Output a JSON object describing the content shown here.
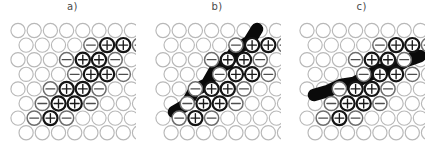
{
  "figure": {
    "background": "#ffffff",
    "panel_count": 3,
    "grid": {
      "rows": 8,
      "cols": 8,
      "spacing_x": 16.2,
      "spacing_y": 14.6,
      "row_offset_x": 8.1,
      "radius": 7.1,
      "origin_x": 9.0,
      "origin_y": 8.5
    },
    "colors": {
      "empty_stroke": "#b8b8b8",
      "minus_stroke": "#6e6e6e",
      "plus_stroke": "#141414",
      "band": "#0a0a0a",
      "label": "#4a4a4a",
      "page_background": "#ffffff"
    },
    "legend_symbols": {
      "empty": "",
      "minus": "−",
      "plus": "+"
    }
  },
  "panels": [
    {
      "id": "panel-a",
      "label": "a)",
      "has_band": false,
      "band_points": [],
      "band_width": 0,
      "charges": [
        {
          "row": 1,
          "col": 4,
          "type": "minus"
        },
        {
          "row": 1,
          "col": 5,
          "type": "plus"
        },
        {
          "row": 1,
          "col": 6,
          "type": "plus"
        },
        {
          "row": 1,
          "col": 7,
          "type": "minus"
        },
        {
          "row": 2,
          "col": 3,
          "type": "minus"
        },
        {
          "row": 2,
          "col": 4,
          "type": "plus"
        },
        {
          "row": 2,
          "col": 5,
          "type": "plus"
        },
        {
          "row": 2,
          "col": 6,
          "type": "minus"
        },
        {
          "row": 3,
          "col": 3,
          "type": "minus"
        },
        {
          "row": 3,
          "col": 4,
          "type": "plus"
        },
        {
          "row": 3,
          "col": 5,
          "type": "plus"
        },
        {
          "row": 3,
          "col": 6,
          "type": "minus"
        },
        {
          "row": 4,
          "col": 2,
          "type": "minus"
        },
        {
          "row": 4,
          "col": 3,
          "type": "plus"
        },
        {
          "row": 4,
          "col": 4,
          "type": "plus"
        },
        {
          "row": 4,
          "col": 5,
          "type": "minus"
        },
        {
          "row": 5,
          "col": 1,
          "type": "minus"
        },
        {
          "row": 5,
          "col": 2,
          "type": "plus"
        },
        {
          "row": 5,
          "col": 3,
          "type": "plus"
        },
        {
          "row": 5,
          "col": 4,
          "type": "minus"
        },
        {
          "row": 6,
          "col": 1,
          "type": "minus"
        },
        {
          "row": 6,
          "col": 2,
          "type": "plus"
        },
        {
          "row": 6,
          "col": 3,
          "type": "minus"
        }
      ]
    },
    {
      "id": "panel-b",
      "label": "b)",
      "has_band": true,
      "band_width": 12.5,
      "band_points": [
        [
          103.0,
          7.0
        ],
        [
          95.0,
          20.0
        ],
        [
          82.0,
          27.0
        ],
        [
          74.0,
          41.0
        ],
        [
          61.0,
          48.0
        ],
        [
          53.0,
          62.0
        ],
        [
          40.0,
          69.0
        ],
        [
          32.0,
          83.0
        ],
        [
          20.0,
          90.0
        ]
      ],
      "charges": [
        {
          "row": 1,
          "col": 4,
          "type": "minus"
        },
        {
          "row": 1,
          "col": 5,
          "type": "plus"
        },
        {
          "row": 1,
          "col": 6,
          "type": "plus"
        },
        {
          "row": 1,
          "col": 7,
          "type": "minus"
        },
        {
          "row": 2,
          "col": 3,
          "type": "minus"
        },
        {
          "row": 2,
          "col": 4,
          "type": "plus"
        },
        {
          "row": 2,
          "col": 5,
          "type": "plus"
        },
        {
          "row": 2,
          "col": 6,
          "type": "minus"
        },
        {
          "row": 3,
          "col": 3,
          "type": "minus"
        },
        {
          "row": 3,
          "col": 4,
          "type": "plus"
        },
        {
          "row": 3,
          "col": 5,
          "type": "plus"
        },
        {
          "row": 3,
          "col": 6,
          "type": "minus"
        },
        {
          "row": 4,
          "col": 2,
          "type": "minus"
        },
        {
          "row": 4,
          "col": 3,
          "type": "plus"
        },
        {
          "row": 4,
          "col": 4,
          "type": "plus"
        },
        {
          "row": 4,
          "col": 5,
          "type": "minus"
        },
        {
          "row": 5,
          "col": 1,
          "type": "minus"
        },
        {
          "row": 5,
          "col": 2,
          "type": "plus"
        },
        {
          "row": 5,
          "col": 3,
          "type": "plus"
        },
        {
          "row": 5,
          "col": 4,
          "type": "minus"
        },
        {
          "row": 6,
          "col": 1,
          "type": "minus"
        },
        {
          "row": 6,
          "col": 2,
          "type": "plus"
        },
        {
          "row": 6,
          "col": 3,
          "type": "minus"
        }
      ]
    },
    {
      "id": "panel-c",
      "label": "c)",
      "has_band": true,
      "band_width": 12.5,
      "band_points": [
        [
          122.0,
          34.0
        ],
        [
          108.0,
          39.0
        ],
        [
          95.0,
          46.0
        ],
        [
          82.0,
          48.0
        ],
        [
          69.0,
          54.0
        ],
        [
          56.0,
          61.0
        ],
        [
          43.0,
          63.0
        ],
        [
          30.0,
          69.0
        ],
        [
          16.0,
          73.0
        ]
      ],
      "charges": [
        {
          "row": 1,
          "col": 4,
          "type": "minus"
        },
        {
          "row": 1,
          "col": 5,
          "type": "plus"
        },
        {
          "row": 1,
          "col": 6,
          "type": "plus"
        },
        {
          "row": 1,
          "col": 7,
          "type": "minus"
        },
        {
          "row": 2,
          "col": 3,
          "type": "minus"
        },
        {
          "row": 2,
          "col": 4,
          "type": "plus"
        },
        {
          "row": 2,
          "col": 5,
          "type": "plus"
        },
        {
          "row": 2,
          "col": 6,
          "type": "minus"
        },
        {
          "row": 3,
          "col": 3,
          "type": "minus"
        },
        {
          "row": 3,
          "col": 4,
          "type": "plus"
        },
        {
          "row": 3,
          "col": 5,
          "type": "plus"
        },
        {
          "row": 3,
          "col": 6,
          "type": "minus"
        },
        {
          "row": 4,
          "col": 2,
          "type": "minus"
        },
        {
          "row": 4,
          "col": 3,
          "type": "plus"
        },
        {
          "row": 4,
          "col": 4,
          "type": "plus"
        },
        {
          "row": 4,
          "col": 5,
          "type": "minus"
        },
        {
          "row": 5,
          "col": 1,
          "type": "minus"
        },
        {
          "row": 5,
          "col": 2,
          "type": "plus"
        },
        {
          "row": 5,
          "col": 3,
          "type": "plus"
        },
        {
          "row": 5,
          "col": 4,
          "type": "minus"
        },
        {
          "row": 6,
          "col": 1,
          "type": "minus"
        },
        {
          "row": 6,
          "col": 2,
          "type": "plus"
        },
        {
          "row": 6,
          "col": 3,
          "type": "minus"
        }
      ]
    }
  ]
}
